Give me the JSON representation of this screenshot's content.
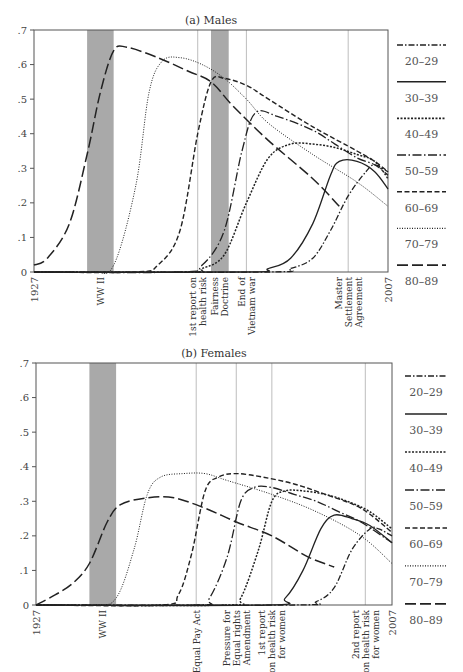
{
  "chart_data": [
    {
      "type": "line",
      "title": "(a) Males",
      "xlabel": "",
      "ylabel": "",
      "xlim": [
        1927,
        2007
      ],
      "ylim": [
        0,
        0.7
      ],
      "yticks": [
        0,
        0.1,
        0.2,
        0.3,
        0.4,
        0.5,
        0.6,
        0.7
      ],
      "ytick_labels": [
        "0",
        ".1",
        ".2",
        ".3",
        ".4",
        ".5",
        ".6",
        ".7"
      ],
      "x_tick_labels": [
        "1927",
        "2007"
      ],
      "grid": false,
      "legend_position": "right",
      "shaded_periods": [
        {
          "label": "WW II",
          "start": 1939,
          "end": 1945
        },
        {
          "label": "Fairness Doctrine",
          "start": 1967,
          "end": 1971
        }
      ],
      "event_lines": [
        {
          "label": "1st report on health risk",
          "year": 1964
        },
        {
          "label": "End of Vietnam war",
          "year": 1975
        },
        {
          "label": "Master Settlement Agreement",
          "year": 1998
        }
      ],
      "series": [
        {
          "name": "20–29",
          "style": "dash-dot",
          "x": [
            1927,
            1980,
            1985,
            1990,
            1994,
            1998,
            2002,
            2004,
            2007
          ],
          "values": [
            0,
            0.0,
            0.01,
            0.04,
            0.12,
            0.22,
            0.29,
            0.31,
            0.29
          ]
        },
        {
          "name": "30–39",
          "style": "solid",
          "x": [
            1927,
            1975,
            1980,
            1985,
            1990,
            1994,
            1996,
            2000,
            2004,
            2007
          ],
          "values": [
            0,
            0.0,
            0.01,
            0.04,
            0.14,
            0.28,
            0.32,
            0.32,
            0.29,
            0.24
          ]
        },
        {
          "name": "40–49",
          "style": "dotted",
          "x": [
            1927,
            1962,
            1965,
            1970,
            1975,
            1980,
            1985,
            1990,
            1995,
            2000,
            2004,
            2007
          ],
          "values": [
            0,
            0.0,
            0.01,
            0.05,
            0.2,
            0.33,
            0.37,
            0.37,
            0.36,
            0.34,
            0.32,
            0.27
          ]
        },
        {
          "name": "50–59",
          "style": "long-dash-dot",
          "x": [
            1927,
            1960,
            1965,
            1970,
            1974,
            1977,
            1982,
            1990,
            1995,
            2000,
            2004,
            2007
          ],
          "values": [
            0,
            0.0,
            0.02,
            0.12,
            0.35,
            0.46,
            0.45,
            0.41,
            0.37,
            0.33,
            0.31,
            0.28
          ]
        },
        {
          "name": "60–69",
          "style": "short-dash",
          "x": [
            1927,
            1950,
            1955,
            1960,
            1964,
            1967,
            1970,
            1975,
            1980,
            1990,
            2000,
            2004,
            2007
          ],
          "values": [
            0,
            0.0,
            0.02,
            0.12,
            0.4,
            0.55,
            0.56,
            0.54,
            0.5,
            0.42,
            0.35,
            0.32,
            0.29
          ]
        },
        {
          "name": "70–79",
          "style": "fine-dotted",
          "x": [
            1927,
            1940,
            1945,
            1950,
            1953,
            1956,
            1960,
            1965,
            1970,
            1975,
            1980,
            1990,
            2000,
            2007
          ],
          "values": [
            0,
            0.0,
            0.02,
            0.25,
            0.52,
            0.61,
            0.62,
            0.6,
            0.56,
            0.5,
            0.43,
            0.34,
            0.26,
            0.19
          ]
        },
        {
          "name": "80–89",
          "style": "long-dash",
          "x": [
            1927,
            1930,
            1935,
            1939,
            1942,
            1945,
            1948,
            1955,
            1962,
            1967,
            1972,
            1980,
            1990,
            1996
          ],
          "values": [
            0.02,
            0.04,
            0.14,
            0.34,
            0.52,
            0.64,
            0.65,
            0.62,
            0.58,
            0.55,
            0.48,
            0.38,
            0.27,
            0.19
          ]
        }
      ]
    },
    {
      "type": "line",
      "title": "(b) Females",
      "xlabel": "",
      "ylabel": "",
      "xlim": [
        1927,
        2007
      ],
      "ylim": [
        0,
        0.7
      ],
      "yticks": [
        0,
        0.1,
        0.2,
        0.3,
        0.4,
        0.5,
        0.6,
        0.7
      ],
      "ytick_labels": [
        "0",
        ".1",
        ".2",
        ".3",
        ".4",
        ".5",
        ".6",
        ".7"
      ],
      "x_tick_labels": [
        "1927",
        "2007"
      ],
      "grid": false,
      "legend_position": "right",
      "shaded_periods": [
        {
          "label": "WW II",
          "start": 1939,
          "end": 1945
        }
      ],
      "event_lines": [
        {
          "label": "Equal Pay Act",
          "year": 1963
        },
        {
          "label": "Pressure for Equal rights Amendment",
          "year": 1972
        },
        {
          "label": "1st report on health risk for women",
          "year": 1980
        },
        {
          "label": "2nd report on health risk for women",
          "year": 2001
        }
      ],
      "series": [
        {
          "name": "20–29",
          "style": "dash-dot",
          "x": [
            1927,
            1985,
            1990,
            1994,
            1998,
            2002,
            2004,
            2007
          ],
          "values": [
            0,
            0.0,
            0.01,
            0.05,
            0.16,
            0.22,
            0.22,
            0.2
          ]
        },
        {
          "name": "30–39",
          "style": "solid",
          "x": [
            1927,
            1979,
            1983,
            1987,
            1991,
            1994,
            1998,
            2002,
            2007
          ],
          "values": [
            0,
            0.0,
            0.02,
            0.1,
            0.22,
            0.26,
            0.25,
            0.23,
            0.18
          ]
        },
        {
          "name": "40–49",
          "style": "dotted",
          "x": [
            1927,
            1970,
            1973,
            1977,
            1980,
            1983,
            1987,
            1992,
            1997,
            2002,
            2007
          ],
          "values": [
            0,
            0.0,
            0.02,
            0.16,
            0.3,
            0.33,
            0.33,
            0.32,
            0.3,
            0.27,
            0.22
          ]
        },
        {
          "name": "50–59",
          "style": "long-dash-dot",
          "x": [
            1927,
            1963,
            1966,
            1970,
            1973,
            1976,
            1980,
            1985,
            1990,
            1995,
            2000,
            2007
          ],
          "values": [
            0,
            0.0,
            0.02,
            0.14,
            0.3,
            0.34,
            0.34,
            0.32,
            0.3,
            0.27,
            0.24,
            0.18
          ]
        },
        {
          "name": "60–69",
          "style": "short-dash",
          "x": [
            1927,
            1955,
            1959,
            1962,
            1965,
            1968,
            1972,
            1978,
            1985,
            1992,
            2000,
            2007
          ],
          "values": [
            0,
            0.0,
            0.03,
            0.15,
            0.33,
            0.37,
            0.38,
            0.37,
            0.35,
            0.32,
            0.28,
            0.21
          ]
        },
        {
          "name": "70–79",
          "style": "fine-dotted",
          "x": [
            1927,
            1940,
            1945,
            1949,
            1952,
            1955,
            1960,
            1965,
            1970,
            1980,
            1990,
            2000,
            2007
          ],
          "values": [
            0,
            0.0,
            0.02,
            0.16,
            0.32,
            0.37,
            0.38,
            0.38,
            0.36,
            0.32,
            0.27,
            0.2,
            0.12
          ]
        },
        {
          "name": "80–89",
          "style": "long-dash",
          "x": [
            1927,
            1930,
            1935,
            1939,
            1943,
            1946,
            1952,
            1958,
            1965,
            1972,
            1980,
            1988,
            1994
          ],
          "values": [
            0,
            0.02,
            0.06,
            0.12,
            0.24,
            0.29,
            0.31,
            0.31,
            0.28,
            0.24,
            0.2,
            0.14,
            0.11
          ]
        }
      ]
    }
  ],
  "panels": [
    {
      "title": "(a) Males"
    },
    {
      "title": "(b) Females"
    }
  ],
  "legend": [
    "20–29",
    "30–39",
    "40–49",
    "50–59",
    "60–69",
    "70–79",
    "80–89"
  ],
  "axis": {
    "x_start": "1927",
    "x_end": "2007"
  },
  "colors": {
    "line": "#222222",
    "shade": "#a9a9a9",
    "event_line": "#bdbdbd",
    "frame": "#555555"
  }
}
